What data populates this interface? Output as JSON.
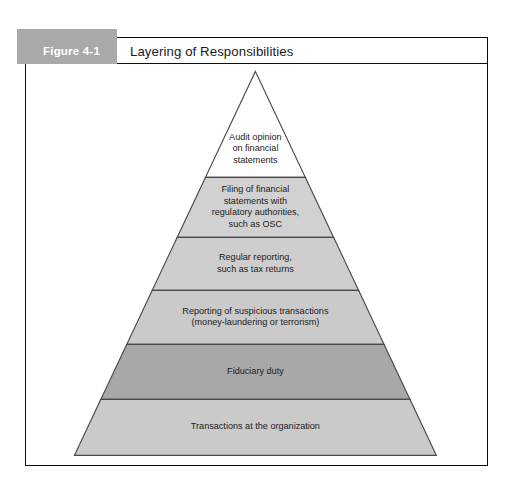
{
  "figure": {
    "number": "Figure 4-1",
    "title": "Layering of Responsibilities"
  },
  "colors": {
    "tab_gray": "#a9a9a9",
    "frame_border": "#0d0d0d",
    "layer_outline": "#4a4a4a",
    "layer_light": "#d0d0d0",
    "layer_dark": "#a8a8a8",
    "layer_white": "#ffffff"
  },
  "chart_data": {
    "type": "pyramid",
    "title": "Layering of Responsibilities",
    "orientation": "apex-top",
    "apex": {
      "x": 256,
      "y": 72
    },
    "base": {
      "left_x": 75,
      "right_x": 437,
      "y": 456
    },
    "layers": [
      {
        "index": 0,
        "label": "Audit opinion\non financial\nstatements",
        "lines": [
          "Audit opinion",
          "on financial",
          "statements"
        ],
        "fill": "#ffffff",
        "top_y": 72,
        "bottom_y": 178
      },
      {
        "index": 1,
        "label": "Filing of financial statements with regulatory authorities, such as OSC",
        "lines": [
          "Filing of financial",
          "statements with",
          "regulatory authorities,",
          "such as OSC"
        ],
        "fill": "#d1d1d1",
        "top_y": 178,
        "bottom_y": 238
      },
      {
        "index": 2,
        "label": "Regular reporting, such as tax returns",
        "lines": [
          "Regular reporting,",
          "such as tax returns"
        ],
        "fill": "#cecece",
        "top_y": 238,
        "bottom_y": 291
      },
      {
        "index": 3,
        "label": "Reporting of suspicious transactions (money-laundering or terrorism)",
        "lines": [
          "Reporting of suspicious transactions",
          "(money-laundering or terrorism)"
        ],
        "fill": "#cacaca",
        "top_y": 291,
        "bottom_y": 345
      },
      {
        "index": 4,
        "label": "Fiduciary duty",
        "lines": [
          "Fiduciary duty"
        ],
        "fill": "#a8a8a8",
        "top_y": 345,
        "bottom_y": 400
      },
      {
        "index": 5,
        "label": "Transactions at the organization",
        "lines": [
          "Transactions at the organization"
        ],
        "fill": "#cacaca",
        "top_y": 400,
        "bottom_y": 456
      }
    ]
  }
}
